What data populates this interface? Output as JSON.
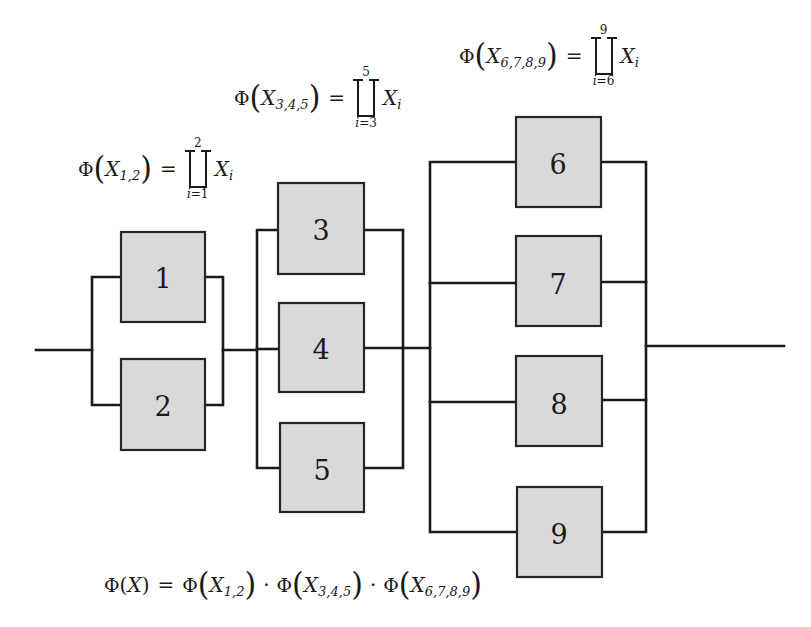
{
  "diagram": {
    "colors": {
      "box_fill": "#d9d9d9",
      "line": "#1a1a1a",
      "background": "#ffffff"
    },
    "blocks": [
      {
        "id": "1",
        "label": "1"
      },
      {
        "id": "2",
        "label": "2"
      },
      {
        "id": "3",
        "label": "3"
      },
      {
        "id": "4",
        "label": "4"
      },
      {
        "id": "5",
        "label": "5"
      },
      {
        "id": "6",
        "label": "6"
      },
      {
        "id": "7",
        "label": "7"
      },
      {
        "id": "8",
        "label": "8"
      },
      {
        "id": "9",
        "label": "9"
      }
    ],
    "groups": [
      {
        "name": "group-1-2",
        "members": [
          "1",
          "2"
        ],
        "arrangement": "parallel"
      },
      {
        "name": "group-3-4-5",
        "members": [
          "3",
          "4",
          "5"
        ],
        "arrangement": "parallel"
      },
      {
        "name": "group-6-7-8-9",
        "members": [
          "6",
          "7",
          "8",
          "9"
        ],
        "arrangement": "parallel"
      }
    ],
    "series_order": [
      "group-1-2",
      "group-3-4-5",
      "group-6-7-8-9"
    ]
  },
  "formulas": {
    "f12": {
      "phi": "Φ",
      "var": "X",
      "sub": "1,2",
      "eq": "=",
      "upper": "2",
      "lower_var": "i",
      "lower_val": "=1",
      "term_var": "X",
      "term_sub": "i"
    },
    "f345": {
      "phi": "Φ",
      "var": "X",
      "sub": "3,4,5",
      "eq": "=",
      "upper": "5",
      "lower_var": "i",
      "lower_val": "=3",
      "term_var": "X",
      "term_sub": "i"
    },
    "f6789": {
      "phi": "Φ",
      "var": "X",
      "sub": "6,7,8,9",
      "eq": "=",
      "upper": "9",
      "lower_var": "i",
      "lower_val": "=6",
      "term_var": "X",
      "term_sub": "i"
    },
    "total": {
      "phi": "Φ",
      "lp": "(",
      "var": "X",
      "rp": ")",
      "eq": "=",
      "terms": [
        {
          "phi": "Φ",
          "var": "X",
          "sub": "1,2"
        },
        {
          "phi": "Φ",
          "var": "X",
          "sub": "3,4,5"
        },
        {
          "phi": "Φ",
          "var": "X",
          "sub": "6,7,8,9"
        }
      ],
      "dot": "·"
    },
    "paren_open": "(",
    "paren_close": ")"
  }
}
